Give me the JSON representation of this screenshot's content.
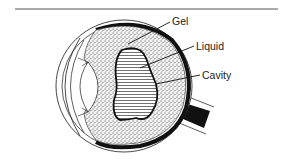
{
  "figure": {
    "labels": [
      {
        "id": "gel",
        "text": "Gel"
      },
      {
        "id": "liquid",
        "text": "Liquid"
      },
      {
        "id": "cavity",
        "text": "Cavity"
      }
    ]
  },
  "colors": {
    "ink": "#111111",
    "rule": "#444444",
    "background": "#ffffff"
  }
}
